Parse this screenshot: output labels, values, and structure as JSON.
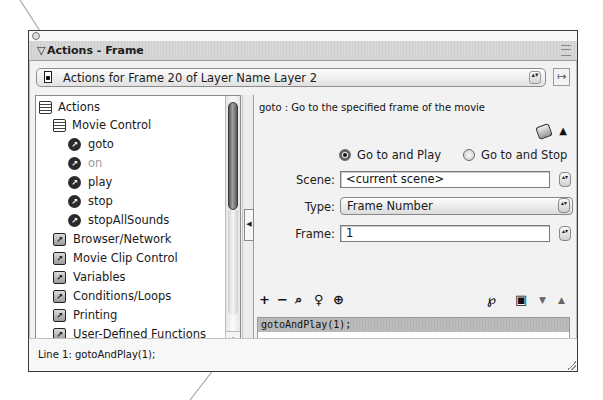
{
  "window": {
    "title": "Actions - Frame",
    "collapse_glyph": "▽"
  },
  "frame_selector": {
    "label": "Actions for Frame 20 of Layer Name Layer 2",
    "stepper_glyph": "▴▾",
    "pin_glyph": "↦"
  },
  "toolbox": {
    "items": [
      {
        "label": "Actions",
        "icon": "book-icon",
        "indent": 0
      },
      {
        "label": "Movie Control",
        "icon": "book-icon",
        "indent": 1
      },
      {
        "label": "goto",
        "icon": "action-circle-icon",
        "indent": 2
      },
      {
        "label": "on",
        "icon": "action-circle-icon",
        "indent": 2,
        "disabled": true
      },
      {
        "label": "play",
        "icon": "action-circle-icon",
        "indent": 2
      },
      {
        "label": "stop",
        "icon": "action-circle-icon",
        "indent": 2
      },
      {
        "label": "stopAllSounds",
        "icon": "action-circle-icon",
        "indent": 2
      },
      {
        "label": "Browser/Network",
        "icon": "category-square-icon",
        "indent": 1
      },
      {
        "label": "Movie Clip Control",
        "icon": "category-square-icon",
        "indent": 1
      },
      {
        "label": "Variables",
        "icon": "category-square-icon",
        "indent": 1
      },
      {
        "label": "Conditions/Loops",
        "icon": "category-square-icon",
        "indent": 1
      },
      {
        "label": "Printing",
        "icon": "category-square-icon",
        "indent": 1
      },
      {
        "label": "User-Defined Functions",
        "icon": "category-square-icon",
        "indent": 1
      }
    ],
    "icon_glyph": "↗",
    "scroll_up": "▲",
    "scroll_down": "▼"
  },
  "splitter": {
    "collapse_glyph": "◀"
  },
  "params": {
    "description": "goto : Go to the specified frame of the movie",
    "collapse_glyph": "▲",
    "radios": [
      {
        "label": "Go to and Play",
        "checked": true
      },
      {
        "label": "Go to and Stop",
        "checked": false
      }
    ],
    "scene_label": "Scene:",
    "scene_value": "<current scene>",
    "type_label": "Type:",
    "type_value": "Frame Number",
    "frame_label": "Frame:",
    "frame_value": "1",
    "stepper_glyph": "▴▾"
  },
  "toolbar": {
    "add": "+",
    "remove": "−",
    "find": "⌕",
    "replace": "♀",
    "target": "⊕",
    "debug": "℘",
    "view_options": "▣",
    "move_down": "▼",
    "move_up": "▲"
  },
  "script": {
    "lines": [
      "gotoAndPlay(1);"
    ]
  },
  "status": {
    "text": "Line 1: gotoAndPlay(1);"
  }
}
